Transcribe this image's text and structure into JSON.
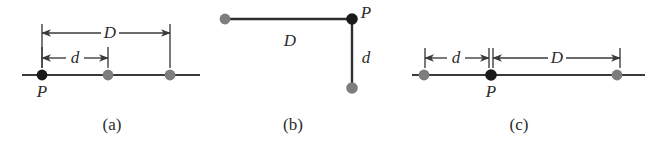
{
  "figure": {
    "type": "physics-diagram",
    "width": 659,
    "height": 146,
    "background_color": "#ffffff",
    "colors": {
      "primary_dot": "#1a1a1a",
      "secondary_dot": "#7d7d7d",
      "line": "#2e2e2e",
      "dimension": "#3a3a3a",
      "text": "#2b2b2b"
    },
    "panels": [
      {
        "id": "panel-a",
        "caption": "(a)",
        "caption_x": 112,
        "caption_y": 130,
        "layout": "collinear-P-at-left",
        "baseline": {
          "y": 75,
          "x1": 22,
          "x2": 200
        },
        "dots": [
          {
            "name": "point-p",
            "x": 42,
            "y": 75,
            "r": 5.4,
            "kind": "primary",
            "label": "P",
            "label_x": 42,
            "label_y": 97
          },
          {
            "name": "point-q",
            "x": 108,
            "y": 75,
            "r": 5.4,
            "kind": "secondary"
          },
          {
            "name": "point-r",
            "x": 170,
            "y": 75,
            "r": 5.4,
            "kind": "secondary"
          }
        ],
        "dimensions": [
          {
            "name": "dimension-d-large",
            "label": "D",
            "x1": 42,
            "x2": 170,
            "y": 33,
            "label_x": 110,
            "label_y": 32,
            "tick_y1": 24,
            "tick_y2": 68
          },
          {
            "name": "dimension-d-small",
            "label": "d",
            "x1": 42,
            "x2": 108,
            "y": 58,
            "label_x": 75,
            "label_y": 57,
            "tick_y1": 47,
            "tick_y2": 68
          }
        ]
      },
      {
        "id": "panel-b",
        "caption": "(b)",
        "caption_x": 293,
        "caption_y": 130,
        "layout": "right-angle-P-at-corner",
        "segments": [
          {
            "name": "segment-horizontal-d",
            "x1": 225,
            "y1": 19,
            "x2": 352,
            "y2": 19
          },
          {
            "name": "segment-vertical-d",
            "x1": 352,
            "y1": 19,
            "x2": 352,
            "y2": 88
          }
        ],
        "dots": [
          {
            "name": "point-q",
            "x": 225,
            "y": 19,
            "r": 5.4,
            "kind": "secondary"
          },
          {
            "name": "point-p",
            "x": 352,
            "y": 19,
            "r": 5.8,
            "kind": "primary",
            "label": "P",
            "label_x": 366,
            "label_y": 18
          },
          {
            "name": "point-r",
            "x": 352,
            "y": 88,
            "r": 5.8,
            "kind": "secondary"
          }
        ],
        "labels": [
          {
            "name": "label-d-large",
            "text": "D",
            "x": 290,
            "y": 40
          },
          {
            "name": "label-d-small",
            "text": "d",
            "x": 366,
            "y": 57
          }
        ]
      },
      {
        "id": "panel-c",
        "caption": "(c)",
        "caption_x": 519,
        "caption_y": 130,
        "layout": "collinear-P-in-middle",
        "baseline": {
          "y": 75,
          "x1": 412,
          "x2": 645
        },
        "dots": [
          {
            "name": "point-q",
            "x": 424,
            "y": 75,
            "r": 5.4,
            "kind": "secondary"
          },
          {
            "name": "point-p",
            "x": 491,
            "y": 75,
            "r": 5.8,
            "kind": "primary",
            "label": "P",
            "label_x": 491,
            "label_y": 97
          },
          {
            "name": "point-r",
            "x": 617,
            "y": 75,
            "r": 5.4,
            "kind": "secondary"
          }
        ],
        "dimensions": [
          {
            "name": "dimension-d-small",
            "label": "d",
            "x1": 425,
            "x2": 489,
            "y": 58,
            "label_x": 456,
            "label_y": 57,
            "tick_y1": 48,
            "tick_y2": 68
          },
          {
            "name": "dimension-d-large",
            "label": "D",
            "x1": 493,
            "x2": 620,
            "y": 58,
            "label_x": 557,
            "label_y": 57,
            "tick_y1": 48,
            "tick_y2": 68
          }
        ]
      }
    ]
  }
}
